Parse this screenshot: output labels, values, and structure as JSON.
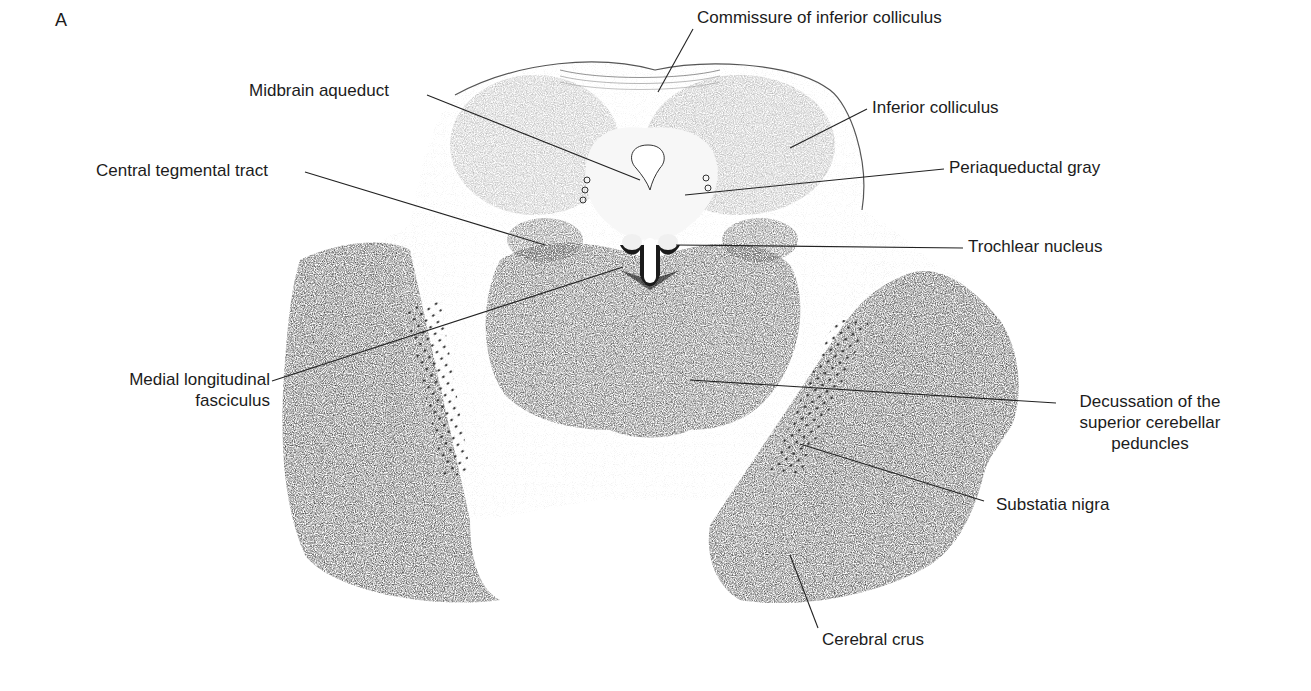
{
  "figure": {
    "panel_letter": "A",
    "colors": {
      "background": "#ffffff",
      "tissue_dark": "#3a3a3a",
      "tissue_mid": "#8a8a8a",
      "tissue_light": "#d8d8d8",
      "leader_line": "#222222",
      "label_text": "#1c1c1c"
    }
  },
  "labels": [
    {
      "id": "commissure-inferior-colliculus",
      "text": "Commissure of inferior colliculus"
    },
    {
      "id": "midbrain-aqueduct",
      "text": "Midbrain aqueduct"
    },
    {
      "id": "inferior-colliculus",
      "text": "Inferior colliculus"
    },
    {
      "id": "central-tegmental-tract",
      "text": "Central tegmental tract"
    },
    {
      "id": "periaqueductal-gray",
      "text": "Periaqueductal gray"
    },
    {
      "id": "trochlear-nucleus",
      "text": "Trochlear nucleus"
    },
    {
      "id": "medial-longitudinal-fasciculus",
      "line1": "Medial longitudinal",
      "line2": "fasciculus"
    },
    {
      "id": "decussation-superior-cerebellar-peduncles",
      "line1": "Decussation of the",
      "line2": "superior cerebellar",
      "line3": "peduncles"
    },
    {
      "id": "substantia-nigra",
      "text": "Substatia nigra"
    },
    {
      "id": "cerebral-crus",
      "text": "Cerebral crus"
    }
  ]
}
